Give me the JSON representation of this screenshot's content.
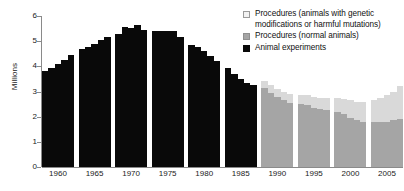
{
  "chart_data": {
    "type": "bar",
    "title": "",
    "subtitle": "",
    "xlabel": "",
    "ylabel": "Millions",
    "ylim": [
      0,
      6
    ],
    "yticks": [
      0,
      1,
      2,
      3,
      4,
      5,
      6
    ],
    "ytick_labels": [
      "0",
      "1",
      "2",
      "3",
      "4",
      "5",
      "6"
    ],
    "grid": false,
    "stacked": true,
    "legend_position": "top-right",
    "legend": [
      {
        "name": "Procedures (animals with genetic modifications or harmful mutations)",
        "color": "#f2f2f2"
      },
      {
        "name": "Procedures (normal animals)",
        "color": "#a5a5a5"
      },
      {
        "name": "Animal experiments",
        "color": "#090909"
      }
    ],
    "xtick_labels": [
      "1960",
      "1965",
      "1970",
      "1975",
      "1980",
      "1985",
      "1990",
      "1995",
      "2000",
      "2005"
    ],
    "x": [
      1958,
      1959,
      1960,
      1961,
      1962,
      1963,
      1964,
      1965,
      1966,
      1967,
      1968,
      1969,
      1970,
      1971,
      1972,
      1973,
      1974,
      1975,
      1976,
      1977,
      1978,
      1979,
      1980,
      1981,
      1982,
      1983,
      1984,
      1985,
      1986,
      1987,
      1988,
      1989,
      1990,
      1991,
      1992,
      1993,
      1994,
      1995,
      1996,
      1997,
      1998,
      1999,
      2000,
      2001,
      2002,
      2003,
      2004,
      2005,
      2006,
      2007
    ],
    "series": [
      {
        "name": "Animal experiments",
        "color": "#090909",
        "values": [
          3.8,
          3.95,
          4.1,
          4.25,
          4.45,
          4.7,
          4.78,
          4.9,
          5.05,
          5.18,
          5.3,
          5.55,
          5.52,
          5.65,
          5.45,
          5.42,
          5.42,
          5.42,
          5.4,
          5.18,
          4.85,
          4.75,
          4.6,
          4.4,
          4.2,
          3.95,
          3.7,
          3.5,
          3.35,
          3.25,
          null,
          null,
          null,
          null,
          null,
          null,
          null,
          null,
          null,
          null,
          null,
          null,
          null,
          null,
          null,
          null,
          null,
          null,
          null,
          null
        ]
      },
      {
        "name": "Procedures (normal animals)",
        "color": "#a5a5a5",
        "values": [
          null,
          null,
          null,
          null,
          null,
          null,
          null,
          null,
          null,
          null,
          null,
          null,
          null,
          null,
          null,
          null,
          null,
          null,
          null,
          null,
          null,
          null,
          null,
          null,
          null,
          null,
          null,
          null,
          null,
          null,
          3.15,
          2.95,
          2.8,
          2.65,
          2.55,
          2.5,
          2.45,
          2.35,
          2.3,
          2.25,
          2.2,
          2.1,
          1.95,
          1.85,
          1.8,
          1.8,
          1.78,
          1.8,
          1.85,
          1.92
        ]
      },
      {
        "name": "Procedures (animals with genetic modifications or harmful mutations)",
        "color": "#d9d9d9",
        "values": [
          null,
          null,
          null,
          null,
          null,
          null,
          null,
          null,
          null,
          null,
          null,
          null,
          null,
          null,
          null,
          null,
          null,
          null,
          null,
          null,
          null,
          null,
          null,
          null,
          null,
          null,
          null,
          null,
          null,
          null,
          0.25,
          0.3,
          0.3,
          0.32,
          0.35,
          0.38,
          0.4,
          0.42,
          0.45,
          0.5,
          0.55,
          0.62,
          0.7,
          0.75,
          0.8,
          0.85,
          0.95,
          1.05,
          1.15,
          1.3
        ]
      }
    ],
    "totals": [
      3.8,
      3.95,
      4.1,
      4.25,
      4.45,
      4.7,
      4.78,
      4.9,
      5.05,
      5.18,
      5.3,
      5.55,
      5.52,
      5.65,
      5.45,
      5.42,
      5.42,
      5.42,
      5.4,
      5.18,
      4.85,
      4.75,
      4.6,
      4.4,
      4.2,
      3.95,
      3.7,
      3.5,
      3.35,
      3.25,
      3.4,
      3.25,
      3.1,
      2.97,
      2.9,
      2.88,
      2.85,
      2.77,
      2.75,
      2.75,
      2.75,
      2.72,
      2.65,
      2.6,
      2.6,
      2.65,
      2.73,
      2.85,
      3.0,
      3.22
    ]
  },
  "axes": {
    "y_title": "Millions"
  }
}
